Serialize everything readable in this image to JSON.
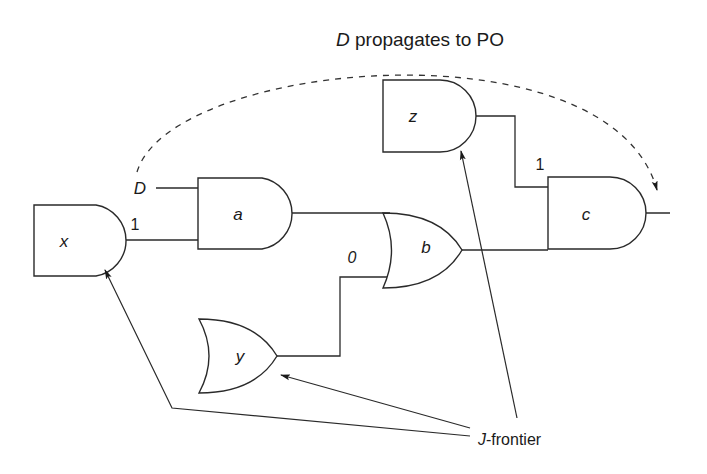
{
  "title": {
    "italic_part": "D",
    "rest": " propagates to PO"
  },
  "gates": {
    "x": {
      "name": "x",
      "type": "AND"
    },
    "a": {
      "name": "a",
      "type": "AND"
    },
    "b": {
      "name": "b",
      "type": "OR"
    },
    "y": {
      "name": "y",
      "type": "OR"
    },
    "z": {
      "name": "z",
      "type": "AND"
    },
    "c": {
      "name": "c",
      "type": "AND"
    }
  },
  "signals": {
    "d_input": "D",
    "x_to_a": "1",
    "y_to_b": "0",
    "z_to_c": "1"
  },
  "annotation": {
    "italic_part": "J",
    "rest": "-frontier",
    "points_to": [
      "x",
      "y",
      "z"
    ]
  },
  "colors": {
    "line": "#2a2a2a",
    "background": "#ffffff"
  }
}
